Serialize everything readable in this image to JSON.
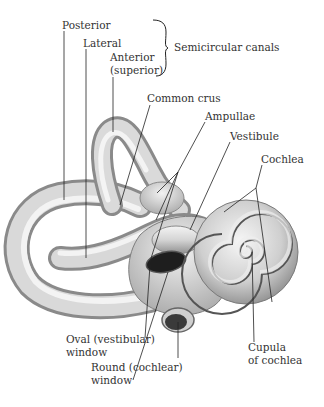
{
  "diagram": {
    "group_label": "Semicircular canals",
    "labels": {
      "posterior": "Posterior",
      "lateral": "Lateral",
      "anterior_line1": "Anterior",
      "anterior_line2": "(superior)",
      "semicircular_canals": "Semicircular canals",
      "common_crus": "Common crus",
      "ampullae": "Ampullae",
      "vestibule": "Vestibule",
      "cochlea": "Cochlea",
      "oval_window_line1": "Oval (vestibular)",
      "oval_window_line2": "window",
      "round_window_line1": "Round (cochlear)",
      "round_window_line2": "window",
      "cupula_line1": "Cupula",
      "cupula_line2": "of cochlea"
    },
    "colors": {
      "background": "#ffffff",
      "text": "#333333",
      "leader_line": "#222222",
      "bone_light": "#f2f2f2",
      "bone_mid": "#bdbdbd",
      "bone_dark": "#7a7a7a",
      "window_dark": "#1a1a1a"
    }
  }
}
